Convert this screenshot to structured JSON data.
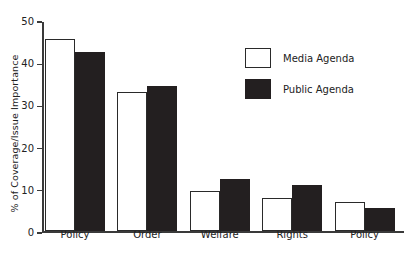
{
  "chart_data": {
    "type": "bar",
    "title": "",
    "xlabel": "",
    "ylabel": "% of Coverage/Issue Importance",
    "ylim": [
      0,
      50
    ],
    "yticks": [
      0,
      10,
      20,
      30,
      40,
      50
    ],
    "grid": false,
    "legend_position": "upper right",
    "categories": [
      "Foreign Policy",
      "Law and Order",
      "Public Welfare",
      "Civil Rights",
      "Fiscal Policy"
    ],
    "category_lines": [
      [
        "Foreign",
        "Policy"
      ],
      [
        "Law and",
        "Order"
      ],
      [
        "Public",
        "Welfare"
      ],
      [
        "Civil",
        "Rights"
      ],
      [
        "Fiscal",
        "Policy"
      ]
    ],
    "series": [
      {
        "name": "Media Agenda",
        "color": "#ffffff",
        "edge_color": "#2a2a2a",
        "values": [
          45.5,
          33.0,
          9.5,
          8.0,
          7.0
        ]
      },
      {
        "name": "Public Agenda",
        "color": "#231f20",
        "edge_color": "#231f20",
        "values": [
          42.5,
          34.5,
          12.5,
          11.0,
          5.5
        ]
      }
    ]
  },
  "axis": {
    "tick_labels": [
      "0",
      "10",
      "20",
      "30",
      "40",
      "50"
    ]
  },
  "legend": {
    "items": [
      {
        "label": "Media Agenda",
        "swatch": "open-square-swatch"
      },
      {
        "label": "Public Agenda",
        "swatch": "filled-square-swatch"
      }
    ]
  }
}
